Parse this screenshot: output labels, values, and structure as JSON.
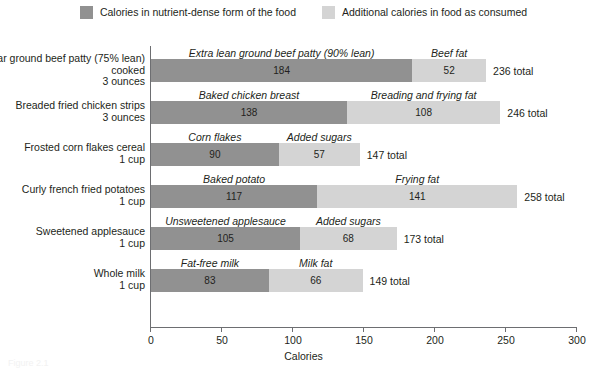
{
  "legend": {
    "entries": [
      {
        "label": "Calories in nutrient-dense form of the food",
        "color": "#919191",
        "swatch_name": "legend-swatch-base"
      },
      {
        "label": "Additional calories in food as consumed",
        "color": "#d4d4d4",
        "swatch_name": "legend-swatch-extra"
      }
    ]
  },
  "axis": {
    "title": "Calories",
    "ticks": [
      "0",
      "50",
      "100",
      "150",
      "200",
      "250",
      "300"
    ]
  },
  "caption": "Figure 2.1",
  "chart_data": {
    "type": "bar",
    "orientation": "horizontal",
    "stacked": true,
    "title": "",
    "xlabel": "Calories",
    "ylabel": "",
    "xlim": [
      0,
      300
    ],
    "xticks": [
      0,
      50,
      100,
      150,
      200,
      250,
      300
    ],
    "grid": false,
    "legend_position": "top-center",
    "series": [
      {
        "name": "Calories in nutrient-dense form of the food",
        "color": "#919191",
        "values": [
          184,
          138,
          90,
          117,
          105,
          83
        ]
      },
      {
        "name": "Additional calories in food as consumed",
        "color": "#d4d4d4",
        "values": [
          52,
          108,
          57,
          141,
          68,
          66
        ]
      }
    ],
    "categories": [
      "Regular ground beef patty (75% lean) cooked 3 ounces",
      "Breaded fried chicken strips 3 ounces",
      "Frosted corn flakes cereal 1 cup",
      "Curly french fried potatoes 1 cup",
      "Sweetened applesauce 1 cup",
      "Whole milk 1 cup"
    ],
    "totals": [
      236,
      246,
      147,
      258,
      173,
      149
    ],
    "rows": [
      {
        "label": "Regular ground beef patty (75% lean) cooked",
        "unit": "3 ounces",
        "base_caption": "Extra lean ground beef patty (90% lean)",
        "base_value": "184",
        "extra_caption": "Beef fat",
        "extra_value": "52",
        "total": "236 total"
      },
      {
        "label": "Breaded fried chicken strips",
        "unit": "3 ounces",
        "base_caption": "Baked chicken breast",
        "base_value": "138",
        "extra_caption": "Breading and frying fat",
        "extra_value": "108",
        "total": "246 total"
      },
      {
        "label": "Frosted corn flakes cereal",
        "unit": "1 cup",
        "base_caption": "Corn flakes",
        "base_value": "90",
        "extra_caption": "Added sugars",
        "extra_value": "57",
        "total": "147 total"
      },
      {
        "label": "Curly french fried potatoes",
        "unit": "1 cup",
        "base_caption": "Baked potato",
        "base_value": "117",
        "extra_caption": "Frying fat",
        "extra_value": "141",
        "total": "258 total"
      },
      {
        "label": "Sweetened applesauce",
        "unit": "1 cup",
        "base_caption": "Unsweetened applesauce",
        "base_value": "105",
        "extra_caption": "Added sugars",
        "extra_value": "68",
        "total": "173 total"
      },
      {
        "label": "Whole milk",
        "unit": "1 cup",
        "base_caption": "Fat-free milk",
        "base_value": "83",
        "extra_caption": "Milk fat",
        "extra_value": "66",
        "total": "149 total"
      }
    ]
  }
}
